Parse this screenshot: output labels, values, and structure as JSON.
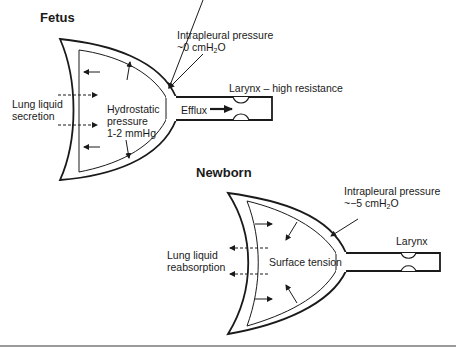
{
  "fetus": {
    "title": "Fetus",
    "intrapleural_line1": "Intrapleural pressure",
    "intrapleural_line2_pre": "~0 cmH",
    "intrapleural_sub": "2",
    "intrapleural_line2_post": "O",
    "larynx": "Larynx – high resistance",
    "secretion_line1": "Lung liquid",
    "secretion_line2": "secretion",
    "hydro_line1": "Hydrostatic",
    "hydro_line2": "pressure",
    "hydro_line3": "1-2 mmHg",
    "efflux": "Efflux"
  },
  "newborn": {
    "title": "Newborn",
    "intrapleural_line1": "Intrapleural pressure",
    "intrapleural_line2_pre": "~−5 cmH",
    "intrapleural_sub": "2",
    "intrapleural_line2_post": "O",
    "larynx": "Larynx",
    "reabsorption_line1": "Lung liquid",
    "reabsorption_line2": "reabsorption",
    "surface_tension": "Surface tension"
  },
  "colors": {
    "stroke": "#1a1a1a",
    "rule": "#9a9a9a"
  }
}
